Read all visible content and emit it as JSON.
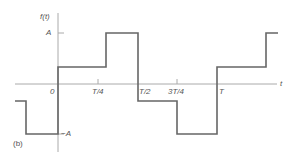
{
  "figure": {
    "panel_label": "(b)",
    "y_axis_label": "f(t)",
    "x_axis_label": "t",
    "amplitude_labels": {
      "positive": "A",
      "negative": "−A"
    },
    "x_ticks": [
      {
        "label": "0"
      },
      {
        "label": "T/4"
      },
      {
        "label": "T/2"
      },
      {
        "label": "3T/4"
      },
      {
        "label": "T"
      }
    ],
    "colors": {
      "waveform": "#666666",
      "axes": "#999999",
      "text": "#555555"
    }
  },
  "waveform": {
    "description": "Staircase periodic waveform: levels -A/3, -A, A/3, A, -A/3, -A, A/3, A",
    "segments": [
      {
        "t_start": "-T/4-",
        "t_end": "-T/4",
        "level": "-A/3"
      },
      {
        "t_start": "-T/4",
        "t_end": "0",
        "level": "-A"
      },
      {
        "t_start": "0",
        "t_end": "T/4",
        "level": "A/3"
      },
      {
        "t_start": "T/4",
        "t_end": "T/2",
        "level": "A"
      },
      {
        "t_start": "T/2",
        "t_end": "3T/4",
        "level": "-A/3"
      },
      {
        "t_start": "3T/4",
        "t_end": "T",
        "level": "-A"
      },
      {
        "t_start": "T",
        "t_end": "5T/4",
        "level": "A/3"
      },
      {
        "t_start": "5T/4",
        "t_end": "5T/4+",
        "level": "A"
      }
    ]
  }
}
